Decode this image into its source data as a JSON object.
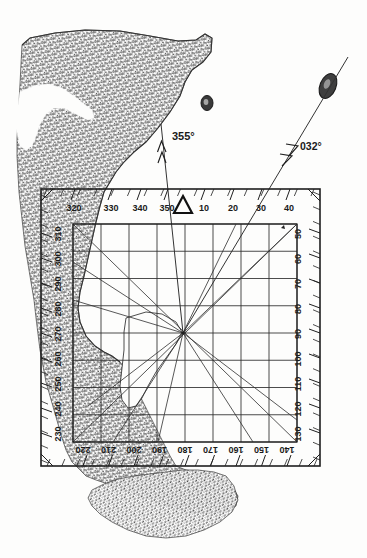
{
  "document": {
    "kind": "nautical-chart-plotting-diagram",
    "title": "Coastal bearing plot with 360-degree compass frame",
    "background_color": "#fdfdfc",
    "ink_color": "#1f1f1f",
    "land_fill_color": "#5a5a5a"
  },
  "chart_data": {
    "type": "scatter",
    "subtitle": "",
    "xlabel": "",
    "ylabel": "",
    "grid": true,
    "legend_position": "none",
    "axis_note": "Outer frame is a full 360-degree bearing scale; labels every 10 degrees, minor ticks every 5 degrees.",
    "scales": {
      "top_edge": {
        "orientation": "horizontal",
        "reading_direction": "left-to-right",
        "labels": [
          "320",
          "330",
          "340",
          "350",
          "10",
          "20",
          "30",
          "40"
        ],
        "north_marker": "triangle",
        "north_value": "0"
      },
      "right_edge": {
        "orientation": "vertical",
        "reading_direction": "top-to-bottom",
        "labels": [
          "50",
          "60",
          "70",
          "80",
          "90",
          "100",
          "110",
          "120",
          "130"
        ]
      },
      "bottom_edge": {
        "orientation": "horizontal",
        "reading_direction": "right-to-left",
        "inverted_text": true,
        "labels": [
          "220",
          "210",
          "200",
          "190",
          "180",
          "170",
          "160",
          "150",
          "140"
        ]
      },
      "left_edge": {
        "orientation": "vertical",
        "reading_direction": "bottom-to-top",
        "labels": [
          "310",
          "300",
          "290",
          "280",
          "270",
          "260",
          "250",
          "240",
          "230"
        ]
      }
    },
    "bearings": [
      {
        "label": "355°",
        "degrees": 355,
        "arrowheads": 2,
        "from": "fix-point",
        "style": "thin-line-with-double-arrow"
      },
      {
        "label": "032°",
        "degrees": 32,
        "arrowheads": 2,
        "from": "fix-point",
        "style": "thin-line-with-double-arrow"
      }
    ],
    "fix_point": {
      "label": "",
      "x_px": 183,
      "y_px": 333
    },
    "features": [
      {
        "name": "mainland-coastline",
        "kind": "land",
        "shading": "stipple-hatched"
      },
      {
        "name": "small-island",
        "kind": "island",
        "shading": "solid-dark"
      },
      {
        "name": "elongated-island",
        "kind": "island",
        "shading": "solid-dark"
      },
      {
        "name": "southern-peninsula",
        "kind": "land",
        "shading": "stipple-hatched"
      }
    ],
    "grid_cells": {
      "columns": 8,
      "rows": 8,
      "diagonals": true
    }
  },
  "labels": {
    "bearing_355": "355°",
    "bearing_032": "032°",
    "north_marker_name": "north-triangle"
  },
  "scale_top": [
    "320",
    "330",
    "340",
    "350",
    "10",
    "20",
    "30",
    "40"
  ],
  "scale_right": [
    "50",
    "60",
    "70",
    "80",
    "90",
    "100",
    "110",
    "120",
    "130"
  ],
  "scale_bottom": [
    "220",
    "210",
    "200",
    "190",
    "180",
    "170",
    "160",
    "150",
    "140"
  ],
  "scale_left": [
    "310",
    "300",
    "290",
    "280",
    "270",
    "260",
    "250",
    "240",
    "230"
  ]
}
